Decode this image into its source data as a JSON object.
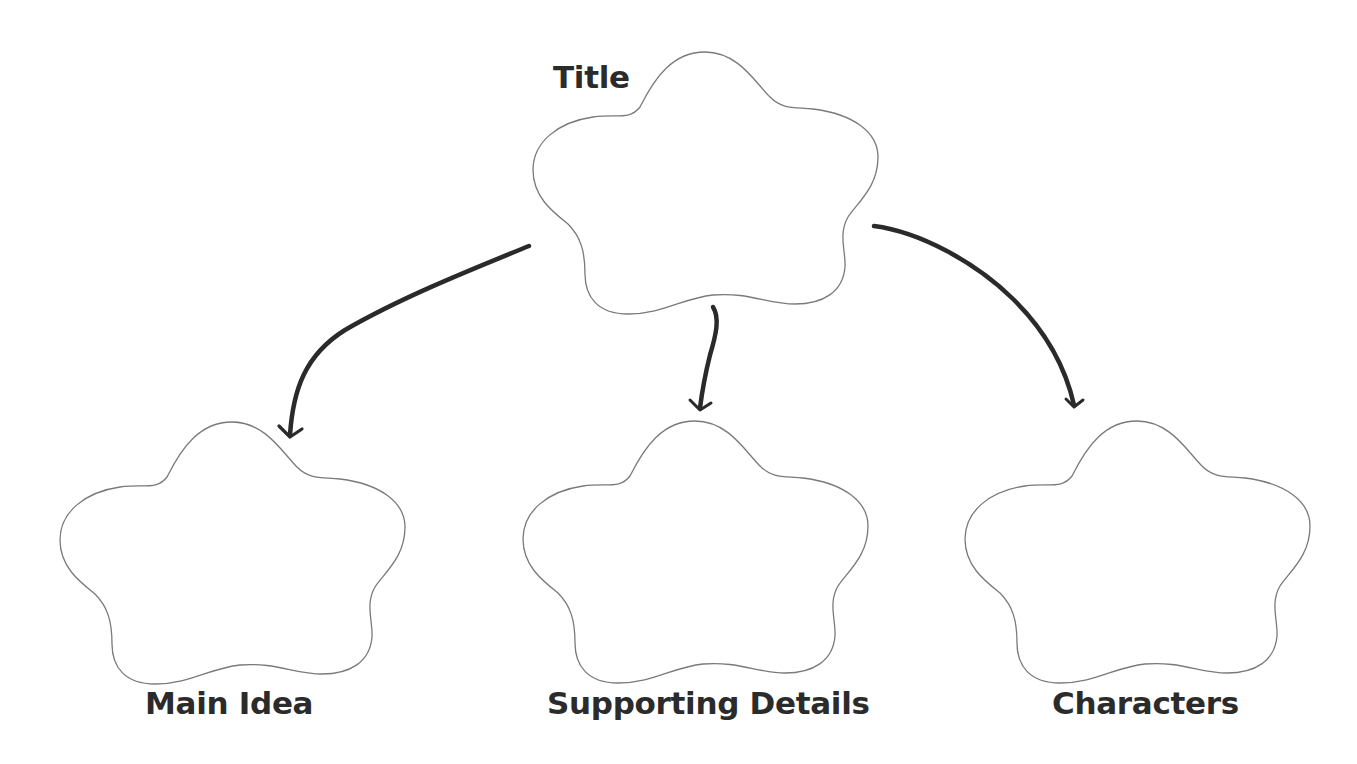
{
  "diagram": {
    "type": "graphic-organizer",
    "nodes": [
      {
        "id": "title",
        "label": "Title",
        "content": ""
      },
      {
        "id": "main-idea",
        "label": "Main Idea",
        "content": ""
      },
      {
        "id": "supporting-details",
        "label": "Supporting Details",
        "content": ""
      },
      {
        "id": "characters",
        "label": "Characters",
        "content": ""
      }
    ],
    "edges": [
      {
        "from": "title",
        "to": "main-idea"
      },
      {
        "from": "title",
        "to": "supporting-details"
      },
      {
        "from": "title",
        "to": "characters"
      }
    ],
    "colors": {
      "outline": "#7a7a7a",
      "arrow": "#2a2a2a",
      "label": "#2b2b2b",
      "background": "#ffffff"
    }
  }
}
